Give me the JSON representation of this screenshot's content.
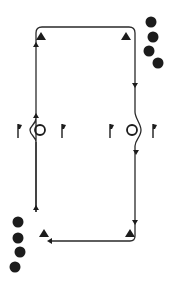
{
  "diagram": {
    "title": "Passing drill: two-lane loop with cones, flags and rings",
    "colors": {
      "line": "#2a2a2a",
      "fill": "#1c1c1c",
      "background": "#ffffff"
    },
    "path": {
      "top_y": 27,
      "bottom_y": 241,
      "left_x": 36,
      "right_x": 135,
      "direction": "clockwise: up left lane, across top, down right lane, back across bottom"
    },
    "cones": [
      {
        "x": 41,
        "y": 36
      },
      {
        "x": 126,
        "y": 36
      },
      {
        "x": 44,
        "y": 233
      },
      {
        "x": 130,
        "y": 233
      }
    ],
    "player_groups": [
      {
        "side": "top-right",
        "count": 4,
        "positions": [
          [
            151,
            22
          ],
          [
            153,
            37
          ],
          [
            149,
            51
          ],
          [
            158,
            63
          ]
        ]
      },
      {
        "side": "bottom-left",
        "count": 4,
        "positions": [
          [
            18,
            222
          ],
          [
            18,
            238
          ],
          [
            20,
            252
          ],
          [
            15,
            267
          ]
        ]
      }
    ],
    "rings": [
      {
        "x": 40,
        "y": 130
      },
      {
        "x": 132,
        "y": 130
      }
    ],
    "flags": [
      {
        "x": 18,
        "y": 130
      },
      {
        "x": 62,
        "y": 130
      },
      {
        "x": 110,
        "y": 130
      },
      {
        "x": 153,
        "y": 130
      }
    ],
    "arrows": [
      {
        "x": 36,
        "y": 44,
        "dir": "up"
      },
      {
        "x": 36,
        "y": 113,
        "dir": "up"
      },
      {
        "x": 36,
        "y": 207,
        "dir": "up"
      },
      {
        "x": 135,
        "y": 85,
        "dir": "down"
      },
      {
        "x": 135,
        "y": 152,
        "dir": "down"
      },
      {
        "x": 135,
        "y": 222,
        "dir": "down"
      },
      {
        "x": 50,
        "y": 241,
        "dir": "left"
      }
    ]
  }
}
